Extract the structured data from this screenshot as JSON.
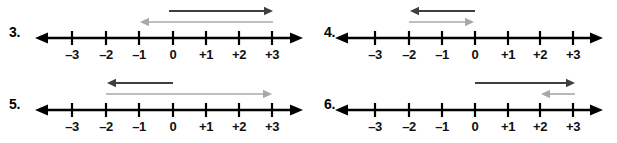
{
  "page": {
    "background_color": "#ffffff"
  },
  "colors": {
    "axis": "#000000",
    "dark_arrow": "#3f3f3f",
    "gray_arrow": "#a8a8a8",
    "label_text": "#111111",
    "number_text": "#000000"
  },
  "tick_labels": [
    "–3",
    "–2",
    "–1",
    "0",
    "+1",
    "+2",
    "+3"
  ],
  "problems": [
    {
      "number": "3.",
      "axis": {
        "left_x": 38,
        "right_x": 300,
        "y": 38,
        "zero_x": 173,
        "spacing": 33,
        "tick_positions": [
          72,
          106,
          139,
          173,
          206,
          239,
          272
        ]
      },
      "arrows": [
        {
          "name": "first-vector",
          "color": "dark",
          "direction": "right",
          "start_value": 0,
          "end_value": 3,
          "start_x": 169,
          "end_x": 273,
          "y": 11
        },
        {
          "name": "second-vector",
          "color": "gray",
          "direction": "left",
          "start_value": 3,
          "end_value": -1,
          "start_x": 273,
          "end_x": 140,
          "y": 22
        }
      ]
    },
    {
      "number": "4.",
      "axis": {
        "left_x": 28,
        "right_x": 290,
        "y": 38,
        "zero_x": 165,
        "spacing": 33,
        "tick_positions": [
          65,
          99,
          132,
          165,
          198,
          230,
          263
        ]
      },
      "arrows": [
        {
          "name": "first-vector",
          "color": "dark",
          "direction": "left",
          "start_value": 0,
          "end_value": -2,
          "start_x": 165,
          "end_x": 100,
          "y": 11
        },
        {
          "name": "second-vector",
          "color": "gray",
          "direction": "right",
          "start_value": -2,
          "end_value": 0,
          "start_x": 99,
          "end_x": 164,
          "y": 22
        }
      ]
    },
    {
      "number": "5.",
      "axis": {
        "left_x": 38,
        "right_x": 300,
        "y": 38,
        "zero_x": 173,
        "spacing": 33,
        "tick_positions": [
          72,
          106,
          139,
          173,
          206,
          239,
          272
        ]
      },
      "arrows": [
        {
          "name": "first-vector",
          "color": "dark",
          "direction": "left",
          "start_value": 0,
          "end_value": -2,
          "start_x": 173,
          "end_x": 107,
          "y": 11
        },
        {
          "name": "second-vector",
          "color": "gray",
          "direction": "right",
          "start_value": -2,
          "end_value": 3,
          "start_x": 106,
          "end_x": 272,
          "y": 22
        }
      ]
    },
    {
      "number": "6.",
      "axis": {
        "left_x": 28,
        "right_x": 290,
        "y": 38,
        "zero_x": 165,
        "spacing": 33,
        "tick_positions": [
          65,
          99,
          132,
          165,
          198,
          230,
          263
        ]
      },
      "arrows": [
        {
          "name": "first-vector",
          "color": "dark",
          "direction": "right",
          "start_value": 0,
          "end_value": 3,
          "start_x": 165,
          "end_x": 265,
          "y": 11
        },
        {
          "name": "second-vector",
          "color": "gray",
          "direction": "left",
          "start_value": 3,
          "end_value": 2,
          "start_x": 265,
          "end_x": 231,
          "y": 22
        }
      ]
    }
  ]
}
